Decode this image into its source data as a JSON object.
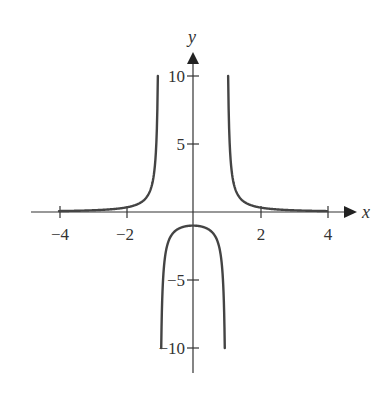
{
  "chart_data": {
    "type": "line",
    "title": "",
    "xlabel": "x",
    "ylabel": "y",
    "xlim": [
      -4.8,
      4.8
    ],
    "ylim": [
      -12,
      12
    ],
    "grid": false,
    "legend": null,
    "x_ticks": [
      -4,
      -2,
      2,
      4
    ],
    "x_tick_labels": [
      "−4",
      "−2",
      "2",
      "4"
    ],
    "y_ticks": [
      10,
      5,
      -5,
      -10
    ],
    "y_tick_labels": [
      "10",
      "5",
      "−5",
      "−10"
    ],
    "vertical_asymptotes": [
      -1,
      1
    ],
    "horizontal_asymptote": 0,
    "series": [
      {
        "name": "f(x) left branch",
        "x": [
          -4,
          -3,
          -2,
          -1.5,
          -1.2,
          -1.1,
          -1.05
        ],
        "y": [
          0.07,
          0.13,
          0.33,
          0.8,
          2.27,
          4.76,
          9.76
        ]
      },
      {
        "name": "f(x) middle branch",
        "x": [
          -0.95,
          -0.9,
          -0.8,
          -0.5,
          0,
          0.5,
          0.8,
          0.9,
          0.95
        ],
        "y": [
          -10.26,
          -5.26,
          -2.78,
          -1.33,
          -1,
          -1.33,
          -2.78,
          -5.26,
          -10.26
        ]
      },
      {
        "name": "f(x) right branch",
        "x": [
          1.05,
          1.1,
          1.2,
          1.5,
          2,
          3,
          4
        ],
        "y": [
          9.76,
          4.76,
          2.27,
          0.8,
          0.33,
          0.13,
          0.07
        ]
      }
    ]
  },
  "labels": {
    "x_axis": "x",
    "y_axis": "y",
    "x_ticks": [
      "−4",
      "−2",
      "2",
      "4"
    ],
    "y_ticks": [
      "10",
      "5",
      "−5",
      "−10"
    ]
  },
  "colors": {
    "axis": "#333333",
    "curve": "#444444",
    "background": "#ffffff"
  }
}
